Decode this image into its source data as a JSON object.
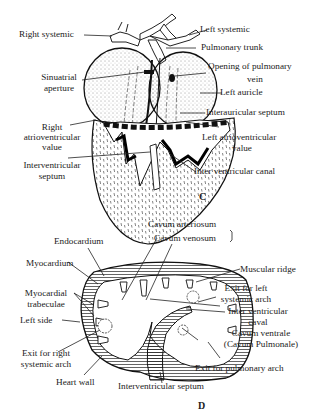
{
  "figure": {
    "panels": [
      {
        "id": "C",
        "caption": "C",
        "subject": "Frog heart, ventral dissection showing atria and ventricle",
        "labels": {
          "right_systemic": "Right systemic",
          "left_systemic": "Left systemic",
          "pulmonary_trunk": "Pulmonary trunk",
          "opening_pulmonary_vein_1": "Opening of pulmonary",
          "opening_pulmonary_vein_2": "vein",
          "sinuatrial_1": "Sinuatrial",
          "sinuatrial_2": "aperture",
          "left_auricle": "Left auricle",
          "interauricular_septum": "Interauricular septum",
          "right_av_1": "Right",
          "right_av_2": "atrioventricular",
          "right_av_3": "value",
          "left_av_1": "Left atrioventricular",
          "left_av_2": "value",
          "interventricular_septum_1": "Interventricular",
          "interventricular_septum_2": "septum",
          "inter_ventricular_canal": "Inter ventricular canal"
        }
      },
      {
        "id": "D",
        "caption": "D",
        "subject": "Transverse section of ventricle",
        "labels": {
          "cavum_arteriosum": "Cavum arteriosum",
          "cavum_venosum": "Cavum venosum",
          "endocardium": "Endocardium",
          "myocardium": "Myocardium",
          "muscular_ridge": "Muscular ridge",
          "myocardial_trabeculae_1": "Myocardial",
          "myocardial_trabeculae_2": "trabeculae",
          "exit_left_systemic_1": "Exit for left",
          "exit_left_systemic_2": "systemic arch",
          "left_side": "Left side",
          "inter_ventricular_caval_1": "Inter ventricular",
          "inter_ventricular_caval_2": "caval",
          "cavum_ventrale_1": "Cavum ventrale",
          "cavum_ventrale_2": "(Cavum Pulmonale)",
          "exit_right_systemic_1": "Exit for right",
          "exit_right_systemic_2": "systemic arch",
          "exit_pulmonary_arch": "Exit for pulmonary arch",
          "heart_wall": "Heart wall",
          "interventricular_septum": "Interventricular septum"
        }
      }
    ]
  }
}
